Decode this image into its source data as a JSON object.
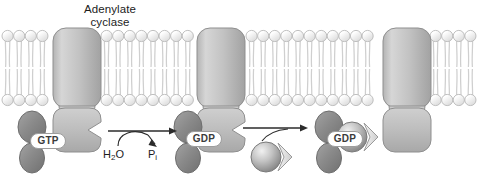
{
  "figure": {
    "title_label": "Adenylate\ncyclase",
    "title_line1": "Adenylate",
    "title_line2": "cyclase",
    "topic": "G-protein cycle at adenylate cyclase",
    "background": "#ffffff"
  },
  "membrane": {
    "name": "lipid-bilayer",
    "head_color": "#f2f2f2",
    "head_stroke": "#b9b9b9",
    "tail_color": "#cfcfcf",
    "top_y": 36,
    "bottom_y": 100,
    "head_radius": 5.6,
    "segments": [
      {
        "x_start": 2,
        "x_end": 52
      },
      {
        "x_start": 101,
        "x_end": 196
      },
      {
        "x_start": 246,
        "x_end": 382
      },
      {
        "x_start": 430,
        "x_end": 478
      }
    ]
  },
  "proteins": [
    {
      "name": "adenylate-cyclase-1",
      "x": 53,
      "labelled": true,
      "notched": false
    },
    {
      "name": "adenylate-cyclase-2",
      "x": 197,
      "labelled": false,
      "notched": false
    },
    {
      "name": "adenylate-cyclase-3",
      "x": 383,
      "labelled": false,
      "notched": false
    }
  ],
  "steps": [
    {
      "id": "step-1",
      "name": "g-alpha-gtp-bound-to-cyclase",
      "nucleotide": "GTP",
      "nucleotide_x": 30,
      "nucleotide_y": 133,
      "alpha_x": 32,
      "description": "G-alpha subunit with GTP docked against adenylate cyclase"
    },
    {
      "id": "step-2",
      "name": "g-alpha-gdp-released",
      "nucleotide": "GDP",
      "nucleotide_x": 186,
      "nucleotide_y": 131,
      "alpha_x": 188,
      "description": "After hydrolysis the G-alpha carries GDP and leaves the notch"
    },
    {
      "id": "step-3",
      "name": "heterotrimer-reassembled",
      "nucleotide": "GDP",
      "nucleotide_x": 327,
      "nucleotide_y": 131,
      "alpha_x": 329,
      "description": "Beta-gamma rejoins G-alpha-GDP reforming the trimer"
    }
  ],
  "reaction": {
    "name": "gtp-hydrolysis",
    "substrate": "H",
    "substrate_sub": "2",
    "substrate_tail": "O",
    "substrate_label": "H2O",
    "product": "P",
    "product_sub": "i",
    "product_label": "Pi",
    "arrow1_x1": 108,
    "arrow1_x2": 176,
    "arrow_y": 131
  },
  "arrow2": {
    "name": "reassociation-arrow",
    "x1": 243,
    "x2": 307,
    "y": 128
  },
  "betagamma": {
    "name": "beta-gamma-subunit",
    "free_cx": 266,
    "free_cy": 157,
    "bound_cx": 352,
    "bound_cy": 137,
    "radius": 15
  },
  "colors": {
    "protein_fill_light": "#cccccc",
    "protein_fill_mid": "#b3b3b3",
    "protein_edge": "#8f8f8f",
    "alpha_dark": "#8c8c8c",
    "alpha_dark_edge": "#6e6e6e",
    "sphere_light": "#e8e8e8",
    "sphere_dark": "#8a8a8a",
    "text": "#1c1c1c",
    "nucleotide_text": "#3b3b3b",
    "nucleotide_bg": "#ffffff"
  }
}
